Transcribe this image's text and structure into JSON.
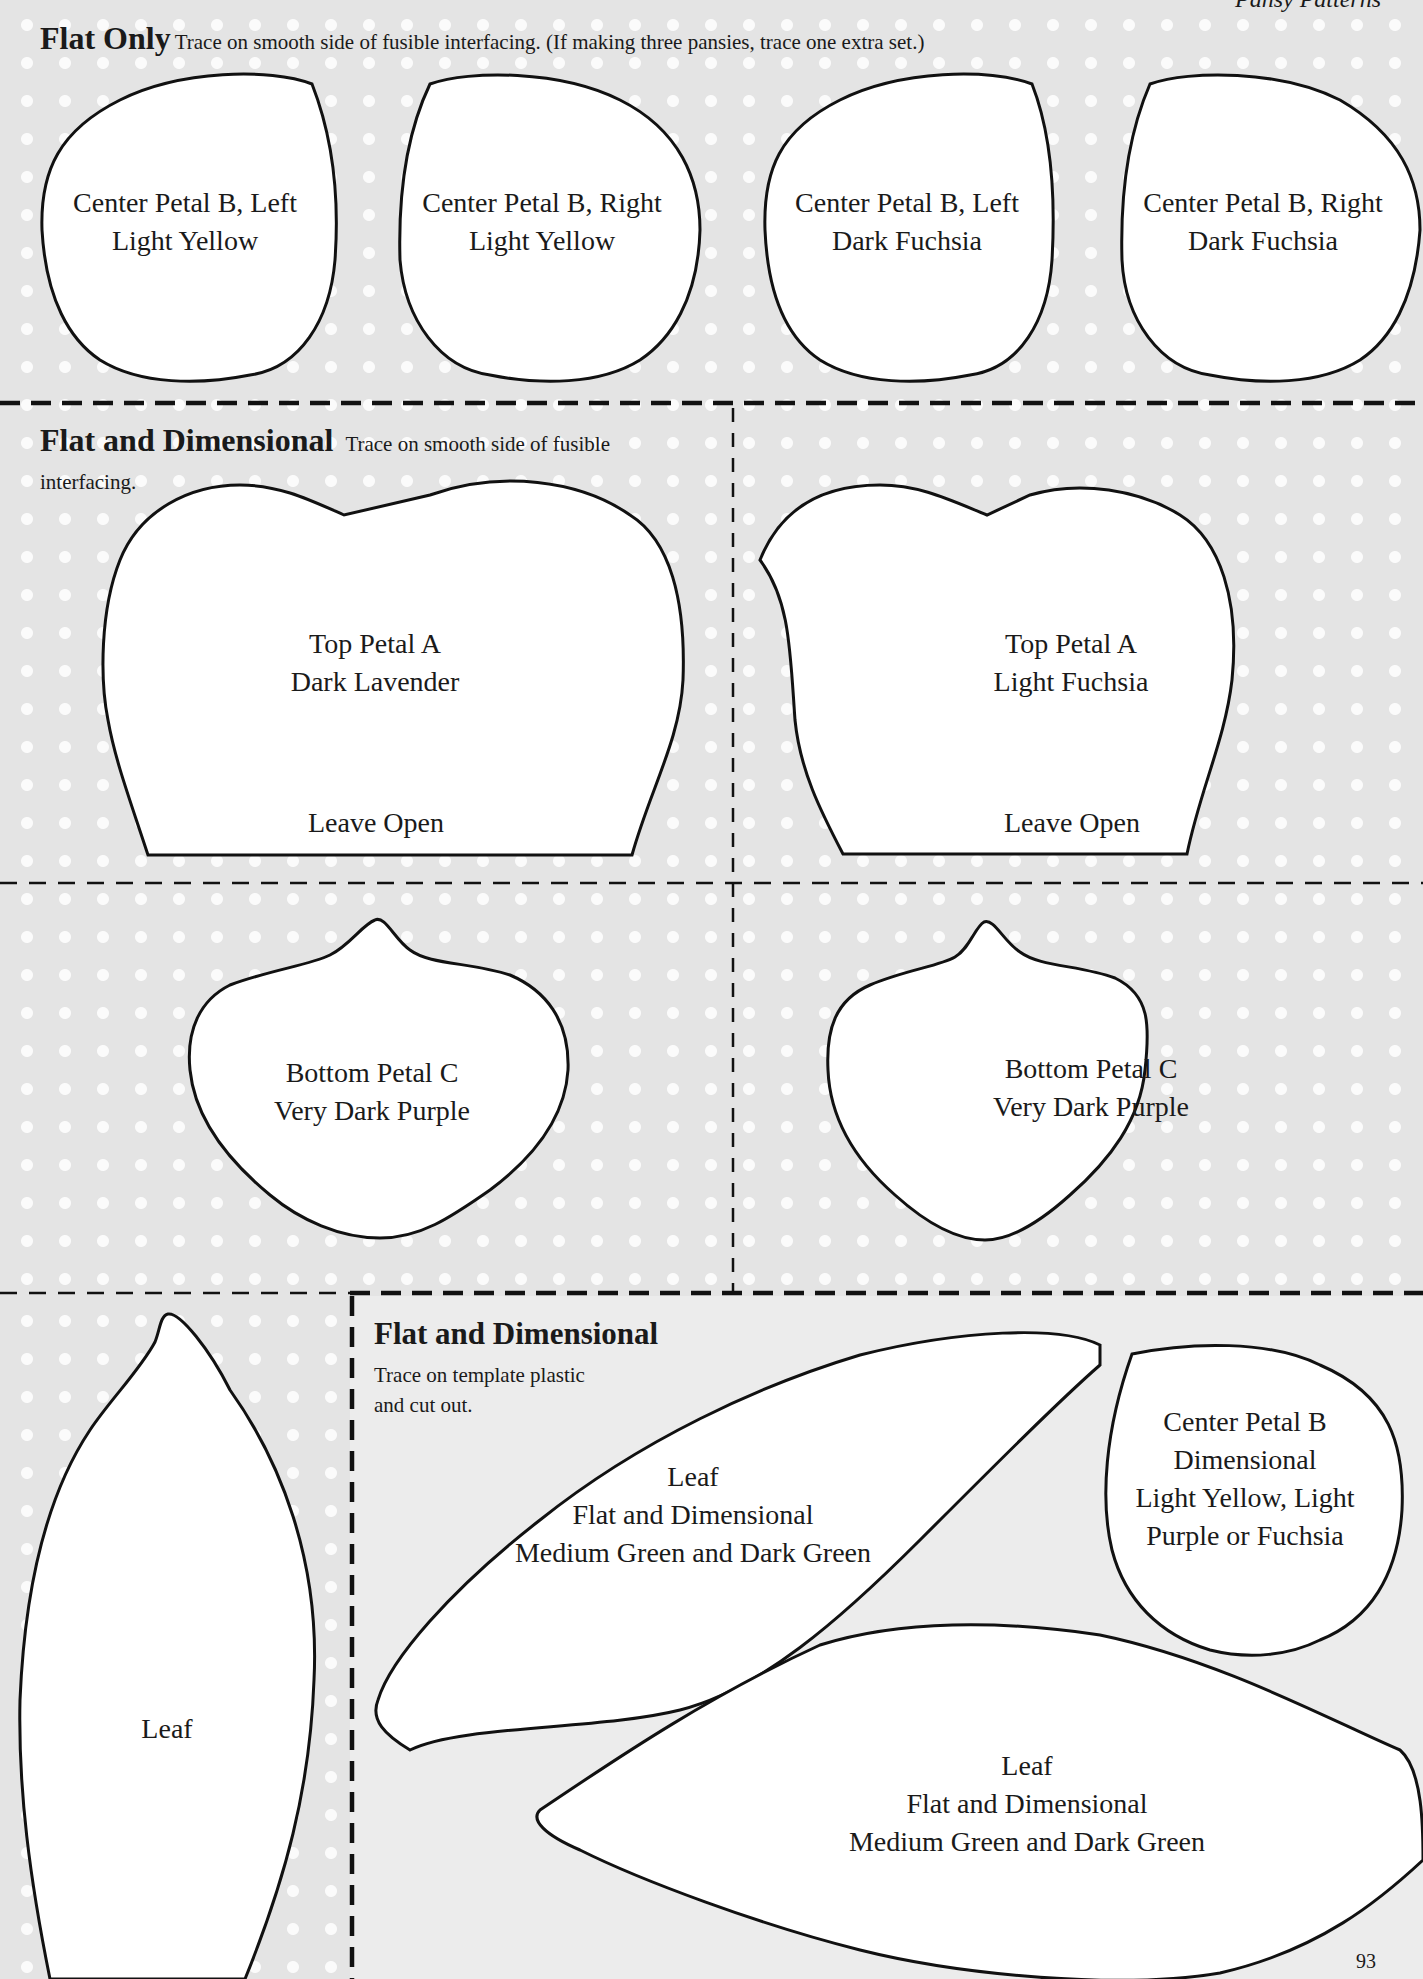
{
  "running_header": "Pansy Patterns",
  "page_number": "93",
  "colors": {
    "background": "#e4e4e4",
    "dot": "#fbfbfb",
    "outline": "#111111",
    "shape_fill": "#ffffff"
  },
  "sections": {
    "flat_only": {
      "title": "Flat Only",
      "note": "Trace on smooth side of fusible interfacing. (If making three pansies, trace one extra set.)",
      "pieces": [
        {
          "name": "Center Petal B, Left",
          "color": "Light Yellow"
        },
        {
          "name": "Center Petal B, Right",
          "color": "Light Yellow"
        },
        {
          "name": "Center Petal B, Left",
          "color": "Dark Fuchsia"
        },
        {
          "name": "Center Petal B, Right",
          "color": "Dark Fuchsia"
        }
      ]
    },
    "flat_and_dimensional": {
      "title": "Flat and Dimensional",
      "note_line1": "Trace on smooth side of fusible",
      "note_line2": "interfacing.",
      "top_petals": [
        {
          "name": "Top Petal A",
          "color": "Dark Lavender",
          "opening": "Leave Open"
        },
        {
          "name": "Top Petal A",
          "color": "Light Fuchsia",
          "opening": "Leave Open"
        }
      ],
      "bottom_petals": [
        {
          "name": "Bottom Petal C",
          "color": "Very Dark Purple"
        },
        {
          "name": "Bottom Petal C",
          "color": "Very Dark Purple"
        }
      ]
    },
    "left_leaf": {
      "name": "Leaf"
    },
    "template_plastic": {
      "title": "Flat and Dimensional",
      "note_line1": "Trace on template plastic",
      "note_line2": "and cut out.",
      "leaves": [
        {
          "name": "Leaf",
          "type": "Flat and Dimensional",
          "color": "Medium Green and Dark Green"
        },
        {
          "name": "Leaf",
          "type": "Flat and Dimensional",
          "color": "Medium Green and Dark Green"
        }
      ],
      "center_petal": {
        "line1": "Center Petal B",
        "line2": "Dimensional",
        "line3": "Light Yellow, Light",
        "line4": "Purple or Fuchsia"
      }
    }
  }
}
